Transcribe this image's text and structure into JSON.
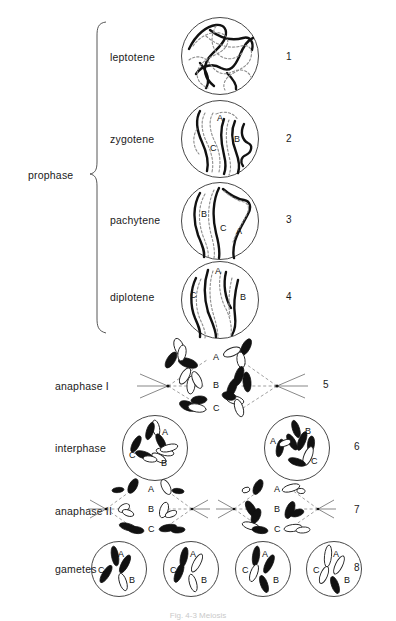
{
  "figure": {
    "caption": "Fig. 4-3  Meiosis",
    "background_color": "#ffffff",
    "ink_color": "#111111"
  },
  "group": {
    "label": "prophase",
    "brace_spans_rows": [
      "leptotene",
      "zygotene",
      "pachytene",
      "diplotene"
    ]
  },
  "rows": [
    {
      "label": "leptotene",
      "number": "1",
      "kind": "single-nucleus",
      "chromosome_labels": []
    },
    {
      "label": "zygotene",
      "number": "2",
      "kind": "single-nucleus",
      "chromosome_labels": [
        "A",
        "B",
        "C"
      ]
    },
    {
      "label": "pachytene",
      "number": "3",
      "kind": "single-nucleus",
      "chromosome_labels": [
        "A",
        "B",
        "C"
      ]
    },
    {
      "label": "diplotene",
      "number": "4",
      "kind": "single-nucleus",
      "chromosome_labels": [
        "A",
        "B",
        "C"
      ]
    },
    {
      "label": "anaphase I",
      "number": "5",
      "kind": "spindle-pair",
      "chromosome_labels": [
        "A",
        "B",
        "C"
      ]
    },
    {
      "label": "interphase",
      "number": "6",
      "kind": "two-nuclei",
      "chromosome_labels": [
        "A",
        "B",
        "C"
      ]
    },
    {
      "label": "anaphase II",
      "number": "7",
      "kind": "spindle-quad",
      "chromosome_labels": [
        "A",
        "B",
        "C"
      ]
    },
    {
      "label": "gametes",
      "number": "8",
      "kind": "four-nuclei",
      "chromosome_labels": [
        "A",
        "B",
        "C"
      ]
    }
  ],
  "chromosome_labels": {
    "a": "A",
    "b": "B",
    "c": "C"
  },
  "legend_note": "Dark shading = paternal chromatids; outline = maternal chromatids"
}
